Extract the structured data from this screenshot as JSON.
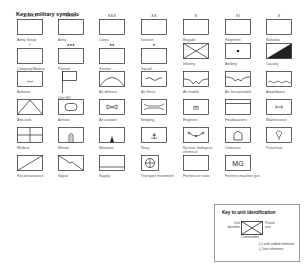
{
  "title": "Key to military symbols",
  "symbols": [
    {
      "label": "Army Group",
      "marker": "XXXXX"
    },
    {
      "label": "Army",
      "marker": "XXXX"
    },
    {
      "label": "Corps",
      "marker": "XXX"
    },
    {
      "label": "Division",
      "marker": "XX"
    },
    {
      "label": "Brigade",
      "marker": "X"
    },
    {
      "label": "Regiment",
      "marker": "III"
    },
    {
      "label": "Battalion",
      "marker": "II"
    },
    {
      "label": "Company/Battery",
      "marker": "I"
    },
    {
      "label": "Platoon",
      "marker": "●●●"
    },
    {
      "label": "Section",
      "marker": "●●"
    },
    {
      "label": "Squad",
      "marker": "●"
    },
    {
      "label": "Infantry"
    },
    {
      "label": "Artillery"
    },
    {
      "label": "Cavalry"
    },
    {
      "label": "Airborne"
    },
    {
      "label": "Unit HQ"
    },
    {
      "label": "Air defence"
    },
    {
      "label": "Air Force"
    },
    {
      "label": "Air mobile"
    },
    {
      "label": "Air transportable"
    },
    {
      "label": "Amphibious"
    },
    {
      "label": "Anti-tank"
    },
    {
      "label": "Armour"
    },
    {
      "label": "Air aviation"
    },
    {
      "label": "Bridging"
    },
    {
      "label": "Engineer",
      "glyph": "m"
    },
    {
      "label": "Headquarters"
    },
    {
      "label": "Maintenance"
    },
    {
      "label": "Medical"
    },
    {
      "label": "Missile"
    },
    {
      "label": "Mountain"
    },
    {
      "label": "Navy",
      "glyph": "⚓"
    },
    {
      "label": "Nuclear, biological, chemical"
    },
    {
      "label": "Ordnance"
    },
    {
      "label": "Parachute"
    },
    {
      "label": "Reconnaissance"
    },
    {
      "label": "Signal"
    },
    {
      "label": "Supply"
    },
    {
      "label": "Transport movement"
    },
    {
      "label": "Fortress or static"
    },
    {
      "label": "Fortress machine gun",
      "glyph": "MG"
    }
  ],
  "unit_key": {
    "title": "Key to unit identification",
    "unit_identifier": "Unit identifier",
    "parent_unit": "Parent unit",
    "commander": "Commander",
    "note_plus": "(+) with added elements",
    "note_minus": "(-) less elements"
  }
}
